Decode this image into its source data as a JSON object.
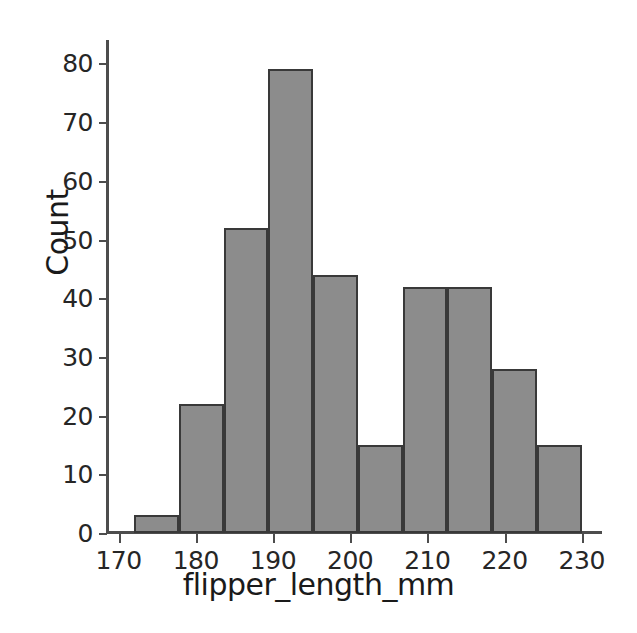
{
  "chart_data": {
    "type": "bar",
    "subtype": "histogram",
    "title": "",
    "xlabel": "flipper_length_mm",
    "ylabel": "Count",
    "xlim": [
      168.5,
      232.5
    ],
    "ylim": [
      0,
      84
    ],
    "xticks": [
      170,
      180,
      190,
      200,
      210,
      220,
      230
    ],
    "yticks": [
      0,
      10,
      20,
      30,
      40,
      50,
      60,
      70,
      80
    ],
    "xtick_labels": [
      "170",
      "180",
      "190",
      "200",
      "210",
      "220",
      "230"
    ],
    "ytick_labels": [
      "0",
      "10",
      "20",
      "30",
      "40",
      "50",
      "60",
      "70",
      "80"
    ],
    "grid": false,
    "legend": null,
    "bin_edges": [
      172.0,
      177.8,
      183.6,
      189.4,
      195.2,
      201.0,
      206.8,
      212.6,
      218.4,
      224.2,
      230.0
    ],
    "categories": [
      "172.0-177.8",
      "177.8-183.6",
      "183.6-189.4",
      "189.4-195.2",
      "195.2-201.0",
      "201.0-206.8",
      "206.8-212.6",
      "212.6-218.4",
      "218.4-224.2",
      "224.2-230.0"
    ],
    "values": [
      3,
      22,
      52,
      79,
      44,
      15,
      42,
      42,
      28,
      15
    ],
    "bar_color": "#8c8c8c",
    "bar_edge_color": "#393939",
    "background_color": "#ffffff",
    "axis_color": "#4d4d4d"
  }
}
